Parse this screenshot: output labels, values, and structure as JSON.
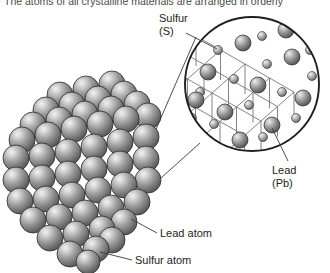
{
  "figure": {
    "caption": "The atoms of all crystalline materials are arranged in orderly",
    "background_color": "#ffffff",
    "width": 330,
    "height": 273
  },
  "labels": {
    "sulfur_element": "Sulfur\n(S)",
    "sulfur_element_line1": "Sulfur",
    "sulfur_element_line2": "(S)",
    "lead_element_line1": "Lead",
    "lead_element_line2": "(Pb)",
    "lead_atom": "Lead atom",
    "sulfur_atom": "Sulfur atom"
  },
  "colors": {
    "sphere_base": "#8f8f8f",
    "sphere_highlight": "#e8e8e8",
    "sphere_shadow": "#4f4f4f",
    "outline": "#2b2b2b",
    "lattice_line": "#6e6e6e",
    "leader_line": "#3a3a3a",
    "text": "#1d1d1d",
    "caption_text": "#4a4a4a"
  },
  "crystal_model": {
    "name": "close-packed-sphere-crystal",
    "description": "Cubic close-packed cluster of spheres representing a galena crystal",
    "sphere_radius": 13,
    "spheres": [
      {
        "cx": 60,
        "cy": 95,
        "r": 13
      },
      {
        "cx": 86,
        "cy": 89,
        "r": 13
      },
      {
        "cx": 112,
        "cy": 84,
        "r": 13
      },
      {
        "cx": 46,
        "cy": 110,
        "r": 13
      },
      {
        "cx": 72,
        "cy": 105,
        "r": 13
      },
      {
        "cx": 98,
        "cy": 99,
        "r": 13
      },
      {
        "cx": 124,
        "cy": 94,
        "r": 13
      },
      {
        "cx": 33,
        "cy": 125,
        "r": 13
      },
      {
        "cx": 59,
        "cy": 120,
        "r": 13
      },
      {
        "cx": 85,
        "cy": 114,
        "r": 13
      },
      {
        "cx": 111,
        "cy": 109,
        "r": 13
      },
      {
        "cx": 137,
        "cy": 104,
        "r": 13
      },
      {
        "cx": 22,
        "cy": 140,
        "r": 13
      },
      {
        "cx": 48,
        "cy": 135,
        "r": 13
      },
      {
        "cx": 74,
        "cy": 129,
        "r": 13
      },
      {
        "cx": 100,
        "cy": 124,
        "r": 13
      },
      {
        "cx": 126,
        "cy": 119,
        "r": 13
      },
      {
        "cx": 148,
        "cy": 116,
        "r": 13
      },
      {
        "cx": 16,
        "cy": 158,
        "r": 13
      },
      {
        "cx": 42,
        "cy": 156,
        "r": 13
      },
      {
        "cx": 68,
        "cy": 152,
        "r": 13
      },
      {
        "cx": 94,
        "cy": 147,
        "r": 13
      },
      {
        "cx": 120,
        "cy": 142,
        "r": 13
      },
      {
        "cx": 146,
        "cy": 137,
        "r": 13
      },
      {
        "cx": 16,
        "cy": 180,
        "r": 13
      },
      {
        "cx": 42,
        "cy": 178,
        "r": 13
      },
      {
        "cx": 68,
        "cy": 174,
        "r": 13
      },
      {
        "cx": 94,
        "cy": 169,
        "r": 13
      },
      {
        "cx": 120,
        "cy": 164,
        "r": 13
      },
      {
        "cx": 146,
        "cy": 159,
        "r": 13
      },
      {
        "cx": 20,
        "cy": 201,
        "r": 13
      },
      {
        "cx": 46,
        "cy": 199,
        "r": 13
      },
      {
        "cx": 72,
        "cy": 195,
        "r": 13
      },
      {
        "cx": 98,
        "cy": 190,
        "r": 13
      },
      {
        "cx": 124,
        "cy": 185,
        "r": 13
      },
      {
        "cx": 148,
        "cy": 180,
        "r": 13
      },
      {
        "cx": 33,
        "cy": 220,
        "r": 13
      },
      {
        "cx": 59,
        "cy": 217,
        "r": 13
      },
      {
        "cx": 85,
        "cy": 213,
        "r": 13
      },
      {
        "cx": 111,
        "cy": 208,
        "r": 13
      },
      {
        "cx": 137,
        "cy": 202,
        "r": 13
      },
      {
        "cx": 50,
        "cy": 238,
        "r": 13
      },
      {
        "cx": 76,
        "cy": 234,
        "r": 13
      },
      {
        "cx": 102,
        "cy": 229,
        "r": 13
      },
      {
        "cx": 124,
        "cy": 222,
        "r": 13
      },
      {
        "cx": 70,
        "cy": 254,
        "r": 13
      },
      {
        "cx": 96,
        "cy": 249,
        "r": 13
      },
      {
        "cx": 112,
        "cy": 240,
        "r": 13
      },
      {
        "cx": 88,
        "cy": 262,
        "r": 12
      }
    ]
  },
  "magnifier": {
    "name": "lattice-magnifier-circle",
    "cx": 252,
    "cy": 84,
    "r": 68,
    "description": "Magnified ball-and-stick view of the PbS cubic lattice"
  },
  "lattice": {
    "large_sphere_radius": 8,
    "small_sphere_radius": 4.5,
    "large_spheres": [
      {
        "cx": 243,
        "cy": 43
      },
      {
        "cx": 292,
        "cy": 57
      },
      {
        "cx": 208,
        "cy": 72
      },
      {
        "cx": 258,
        "cy": 85
      },
      {
        "cx": 303,
        "cy": 98
      },
      {
        "cx": 225,
        "cy": 112
      },
      {
        "cx": 272,
        "cy": 125
      },
      {
        "cx": 240,
        "cy": 140
      },
      {
        "cx": 196,
        "cy": 100
      },
      {
        "cx": 286,
        "cy": 30
      }
    ],
    "small_spheres": [
      {
        "cx": 218,
        "cy": 50
      },
      {
        "cx": 267,
        "cy": 64
      },
      {
        "cx": 312,
        "cy": 76
      },
      {
        "cx": 234,
        "cy": 79
      },
      {
        "cx": 282,
        "cy": 92
      },
      {
        "cx": 200,
        "cy": 92
      },
      {
        "cx": 249,
        "cy": 105
      },
      {
        "cx": 296,
        "cy": 118
      },
      {
        "cx": 214,
        "cy": 124
      },
      {
        "cx": 263,
        "cy": 137
      },
      {
        "cx": 262,
        "cy": 36
      },
      {
        "cx": 310,
        "cy": 50
      },
      {
        "cx": 192,
        "cy": 118
      }
    ]
  },
  "leader_lines": [
    {
      "name": "crystal-to-magnifier-upper",
      "x1": 150,
      "y1": 143,
      "x2": 196,
      "y2": 37
    },
    {
      "name": "crystal-to-magnifier-lower",
      "x1": 152,
      "y1": 186,
      "x2": 200,
      "y2": 143
    },
    {
      "name": "sulfur-element-pointer",
      "x1": 186,
      "y1": 32,
      "x2": 218,
      "y2": 50
    },
    {
      "name": "lead-element-pointer",
      "x1": 288,
      "y1": 161,
      "x2": 271,
      "y2": 128
    },
    {
      "name": "lead-atom-pointer",
      "x1": 157,
      "y1": 233,
      "x2": 131,
      "y2": 219
    },
    {
      "name": "sulfur-atom-pointer",
      "x1": 132,
      "y1": 260,
      "x2": 100,
      "y2": 252
    }
  ]
}
